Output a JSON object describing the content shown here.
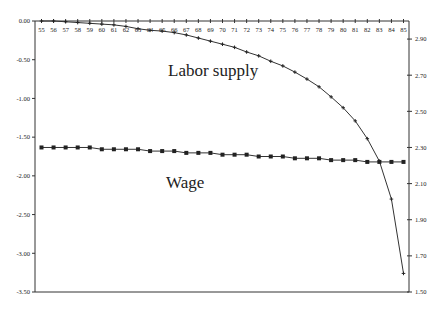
{
  "chart_data": {
    "type": "line",
    "title": "",
    "xlabel": "",
    "ylabel": "",
    "x": [
      55,
      56,
      57,
      58,
      59,
      60,
      61,
      62,
      63,
      64,
      65,
      66,
      67,
      68,
      69,
      70,
      71,
      72,
      73,
      74,
      75,
      76,
      77,
      78,
      79,
      80,
      81,
      82,
      83,
      84,
      85
    ],
    "x_tick_labels": [
      "55",
      "56",
      "57",
      "58",
      "59",
      "60",
      "61",
      "62",
      "63",
      "64",
      "65",
      "66",
      "67",
      "68",
      "69",
      "70",
      "71",
      "72",
      "73",
      "74",
      "75",
      "76",
      "77",
      "78",
      "79",
      "80",
      "81",
      "82",
      "83",
      "84",
      "85"
    ],
    "left_axis": {
      "ylim": [
        -3.5,
        0.0
      ],
      "ticks": [
        0.0,
        -0.5,
        -1.0,
        -1.5,
        -2.0,
        -2.5,
        -3.0,
        -3.5
      ],
      "tick_labels": [
        "0.00",
        "-0.50",
        "-1.00",
        "-1.50",
        "-2.00",
        "-2.50",
        "-3.00",
        "-3.50"
      ]
    },
    "right_axis": {
      "ylim": [
        1.5,
        3.0
      ],
      "ticks": [
        2.9,
        2.7,
        2.5,
        2.3,
        2.1,
        1.9,
        1.7,
        1.5
      ],
      "tick_labels": [
        "2.90",
        "2.70",
        "2.50",
        "2.30",
        "2.10",
        "1.90",
        "1.70",
        "1.50"
      ]
    },
    "grid": false,
    "legend": "none",
    "series": [
      {
        "name": "Labor supply",
        "axis": "left",
        "marker": "plus",
        "values": [
          0.0,
          0.0,
          -0.01,
          -0.02,
          -0.03,
          -0.04,
          -0.05,
          -0.07,
          -0.1,
          -0.12,
          -0.13,
          -0.15,
          -0.18,
          -0.22,
          -0.26,
          -0.3,
          -0.34,
          -0.4,
          -0.45,
          -0.52,
          -0.58,
          -0.66,
          -0.75,
          -0.85,
          -0.98,
          -1.12,
          -1.29,
          -1.52,
          -1.81,
          -2.3,
          -3.26
        ]
      },
      {
        "name": "Wage",
        "axis": "right",
        "marker": "square",
        "values": [
          2.3,
          2.3,
          2.3,
          2.3,
          2.3,
          2.29,
          2.29,
          2.29,
          2.29,
          2.28,
          2.28,
          2.28,
          2.27,
          2.27,
          2.27,
          2.26,
          2.26,
          2.26,
          2.25,
          2.25,
          2.25,
          2.24,
          2.24,
          2.24,
          2.23,
          2.23,
          2.23,
          2.22,
          2.22,
          2.22,
          2.22
        ]
      }
    ],
    "annotations": [
      {
        "text": "Labor supply",
        "series": "Labor supply"
      },
      {
        "text": "Wage",
        "series": "Wage"
      }
    ]
  }
}
